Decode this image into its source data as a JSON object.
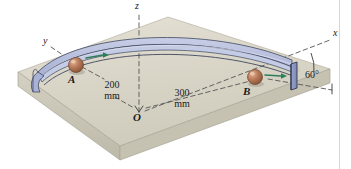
{
  "figure": {
    "kind": "engineering-mechanics-diagram"
  },
  "axes": {
    "x_label": "x",
    "y_label": "y",
    "z_label": "z",
    "origin_label": "O"
  },
  "points": {
    "a_label": "A",
    "b_label": "B"
  },
  "dimensions": {
    "radius_a": {
      "value": "200",
      "unit": "mm"
    },
    "radius_b": {
      "value": "300",
      "unit": "mm"
    }
  },
  "angle": {
    "value": "60°"
  },
  "colors": {
    "slab_top": "#d6d3c4",
    "slab_top_light": "#e2dfd2",
    "slab_front": "#cac6b6",
    "slab_side": "#b9b5a5",
    "track_fill": "#b9c0dd",
    "track_edge": "#4a5068",
    "end_plate": "#8d99c4",
    "ball": "#b9795a",
    "ball_highlight": "#dba98c",
    "arrow": "#2e7d5b",
    "dash": "#4d4d4d",
    "text": "#1a1a1a"
  },
  "icons": {
    "velocity_arrow_a": "arrow-right-icon",
    "velocity_arrow_b": "arrow-right-icon"
  }
}
